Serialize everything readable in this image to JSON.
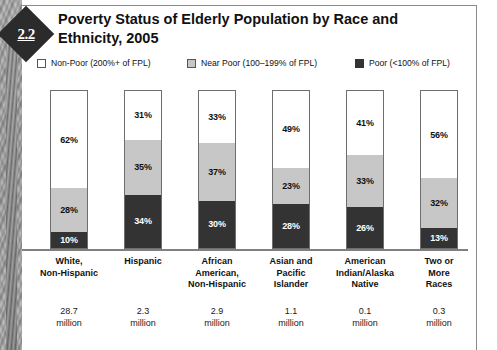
{
  "badge": {
    "number": "2.2"
  },
  "heading": {
    "title": "Poverty Status of Elderly Population by Race and Ethnicity, 2005"
  },
  "legend": {
    "items": [
      {
        "label": "Non-Poor (200%+ of FPL)",
        "swatch": "non-poor-swatch",
        "color": "#ffffff"
      },
      {
        "label": "Near Poor (100–199% of FPL)",
        "swatch": "near-poor-swatch",
        "color": "#c7c7c7"
      },
      {
        "label": "Poor (<100% of FPL)",
        "swatch": "poor-swatch",
        "color": "#333333"
      }
    ]
  },
  "chart_data": {
    "type": "bar",
    "title": "Poverty Status of Elderly Population by Race and Ethnicity, 2005",
    "xlabel": "",
    "ylabel": "",
    "ylim": [
      0,
      100
    ],
    "stacked": true,
    "grid": false,
    "legend_position": "top",
    "categories": [
      "White, Non-Hispanic",
      "Hispanic",
      "African American, Non-Hispanic",
      "Asian and Pacific Islander",
      "American Indian/Alaska Native",
      "Two or More Races"
    ],
    "category_lines": [
      [
        "White,",
        "Non-Hispanic"
      ],
      [
        "Hispanic"
      ],
      [
        "African",
        "American,",
        "Non-Hispanic"
      ],
      [
        "Asian and",
        "Pacific",
        "Islander"
      ],
      [
        "American",
        "Indian/Alaska",
        "Native"
      ],
      [
        "Two or",
        "More",
        "Races"
      ]
    ],
    "series": [
      {
        "name": "Non-Poor (200%+ of FPL)",
        "color": "#ffffff",
        "values": [
          62,
          31,
          33,
          49,
          41,
          56
        ]
      },
      {
        "name": "Near Poor (100–199% of FPL)",
        "color": "#c7c7c7",
        "values": [
          28,
          35,
          37,
          23,
          33,
          32
        ]
      },
      {
        "name": "Poor (<100% of FPL)",
        "color": "#333333",
        "values": [
          10,
          34,
          30,
          28,
          26,
          13
        ]
      }
    ],
    "value_labels": [
      [
        "62%",
        "28%",
        "10%"
      ],
      [
        "31%",
        "35%",
        "34%"
      ],
      [
        "33%",
        "37%",
        "30%"
      ],
      [
        "49%",
        "23%",
        "28%"
      ],
      [
        "41%",
        "33%",
        "26%"
      ],
      [
        "56%",
        "32%",
        "13%"
      ]
    ],
    "population": [
      {
        "value": "28.7",
        "unit": "million"
      },
      {
        "value": "2.3",
        "unit": "million"
      },
      {
        "value": "2.9",
        "unit": "million"
      },
      {
        "value": "1.1",
        "unit": "million"
      },
      {
        "value": "0.1",
        "unit": "million"
      },
      {
        "value": "0.3",
        "unit": "million"
      }
    ]
  }
}
